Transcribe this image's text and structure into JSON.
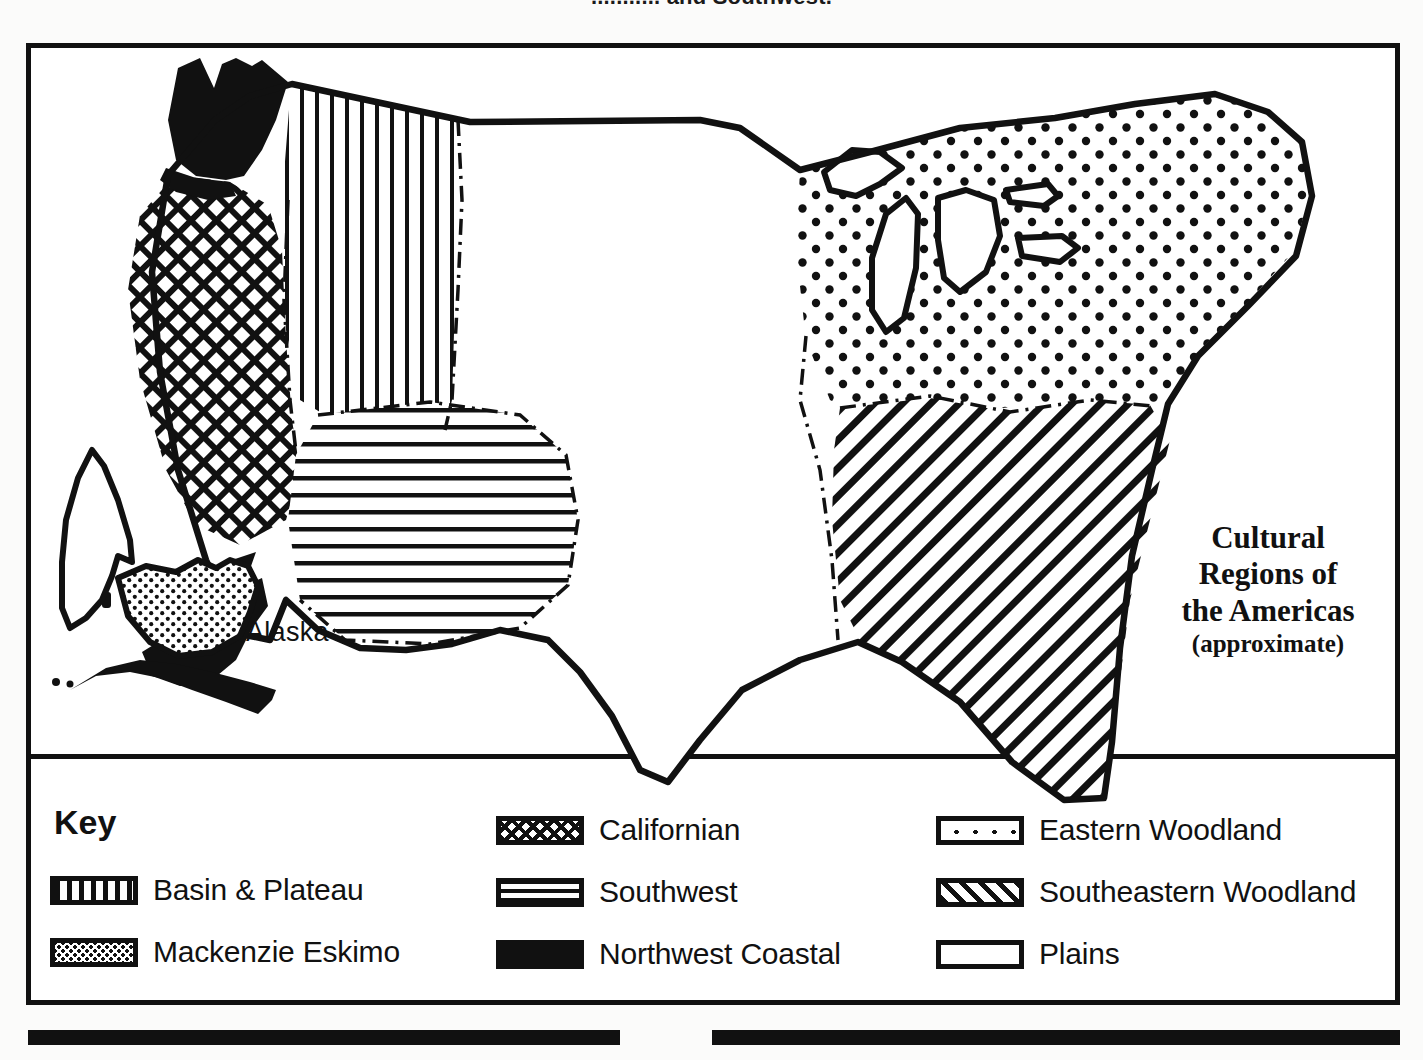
{
  "page": {
    "top_cut_text": "........... and Southwest."
  },
  "map": {
    "title_lines": [
      "Cultural",
      "Regions of",
      "the Americas"
    ],
    "title_approx": "(approximate)",
    "labels": [
      {
        "name": "alaska-label",
        "text": "Alaska"
      }
    ],
    "compass": {
      "name": "north-arrow",
      "direction": "north"
    },
    "regions": [
      {
        "id": "basin-plateau",
        "label": "Basin & Plateau",
        "pattern": "vertical-lines"
      },
      {
        "id": "mackenzie-eskimo",
        "label": "Mackenzie Eskimo",
        "pattern": "dense-dots"
      },
      {
        "id": "californian",
        "label": "Californian",
        "pattern": "crosshatch"
      },
      {
        "id": "southwest",
        "label": "Southwest",
        "pattern": "horizontal-lines"
      },
      {
        "id": "northwest-coastal",
        "label": "Northwest Coastal",
        "pattern": "solid-black"
      },
      {
        "id": "eastern-woodland",
        "label": "Eastern Woodland",
        "pattern": "sparse-dots"
      },
      {
        "id": "southeastern-woodland",
        "label": "Southeastern Woodland",
        "pattern": "diagonal-lines"
      },
      {
        "id": "plains",
        "label": "Plains",
        "pattern": "blank"
      }
    ]
  },
  "key": {
    "title": "Key",
    "columns": [
      {
        "items": [
          {
            "label": "Basin & Plateau",
            "swatch": "sw-vert",
            "icon": "vertical-lines-swatch-icon"
          },
          {
            "label": "Mackenzie Eskimo",
            "swatch": "sw-dots-dense",
            "icon": "dense-dots-swatch-icon"
          }
        ]
      },
      {
        "items": [
          {
            "label": "Californian",
            "swatch": "sw-cross",
            "icon": "crosshatch-swatch-icon"
          },
          {
            "label": "Southwest",
            "swatch": "sw-horiz",
            "icon": "horizontal-lines-swatch-icon"
          },
          {
            "label": "Northwest Coastal",
            "swatch": "sw-solid",
            "icon": "solid-black-swatch-icon"
          }
        ]
      },
      {
        "items": [
          {
            "label": "Eastern Woodland",
            "swatch": "sw-sparse-dots",
            "icon": "sparse-dots-swatch-icon"
          },
          {
            "label": "Southeastern Woodland",
            "swatch": "sw-diag",
            "icon": "diagonal-lines-swatch-icon"
          },
          {
            "label": "Plains",
            "swatch": "sw-plain",
            "icon": "blank-swatch-icon"
          }
        ]
      }
    ]
  },
  "colors": {
    "ink": "#111111",
    "paper": "#ffffff"
  }
}
